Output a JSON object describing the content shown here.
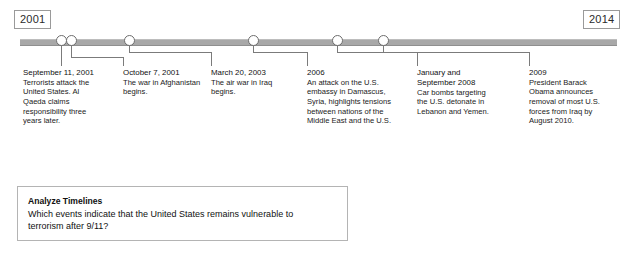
{
  "timeline": {
    "start_year": "2001",
    "end_year": "2014",
    "axis_color": "#a8a8a8",
    "marker_color": "#6d6d6d",
    "connector_color": "#7b7b7b",
    "events": [
      {
        "id": "sept-11-2001",
        "date": "September 11, 2001",
        "description": "Terrorists attack the United States. Al Qaeda claims responsibility three years later."
      },
      {
        "id": "october-7-2001",
        "date": "October 7, 2001",
        "description": "The war in Afghanistan begins."
      },
      {
        "id": "march-20-2003",
        "date": "March 20, 2003",
        "description": "The air war in Iraq begins."
      },
      {
        "id": "year-2006",
        "date": "2006",
        "description": "An attack on the U.S. embassy in Damascus, Syria, highlights tensions between nations of the Middle East and the U.S."
      },
      {
        "id": "jan-sept-2008",
        "date": "January and September 2008",
        "description": "Car bombs targeting the U.S. detonate in Lebanon and Yemen."
      },
      {
        "id": "year-2009",
        "date": "2009",
        "description": "President Barack Obama announces removal of most U.S. forces from Iraq by August 2010."
      }
    ]
  },
  "analyze": {
    "heading": "Analyze Timelines",
    "question": "Which events indicate that the United States remains vulnerable to terrorism after 9/11?"
  }
}
